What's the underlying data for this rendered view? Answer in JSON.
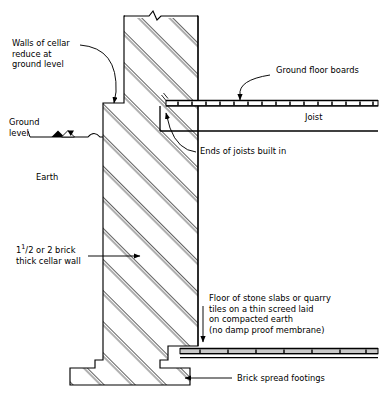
{
  "diagram": {
    "type": "architectural-section",
    "line_color": "#000000",
    "slab_fill": "#c9c9c9",
    "background": "#ffffff"
  },
  "labels": {
    "walls_reduce": {
      "lines": [
        "Walls of cellar",
        "reduce at",
        "ground level"
      ],
      "text": "Walls of cellar reduce at ground level"
    },
    "ground_level": {
      "lines": [
        "Ground",
        "level"
      ],
      "text": "Ground level"
    },
    "earth": {
      "text": "Earth"
    },
    "cellar_wall": {
      "line1_prefix": "1",
      "line1_sup": "1",
      "line1_rest": "/2 or 2 brick",
      "line2": "thick cellar wall",
      "text": "1 1/2 or 2 brick thick cellar wall"
    },
    "ground_floor_boards": {
      "text": "Ground floor boards"
    },
    "joist": {
      "text": "Joist"
    },
    "ends_of_joists": {
      "text": "Ends of joists built in"
    },
    "floor_note": {
      "lines": [
        "Floor of stone slabs or quarry",
        "tiles on a thin screed laid",
        "on compacted earth",
        "(no damp proof membrane)"
      ],
      "text": "Floor of stone slabs or quarry tiles on a thin screed laid on compacted earth (no damp proof membrane)"
    },
    "brick_spread_footings": {
      "text": "Brick spread footings"
    }
  }
}
